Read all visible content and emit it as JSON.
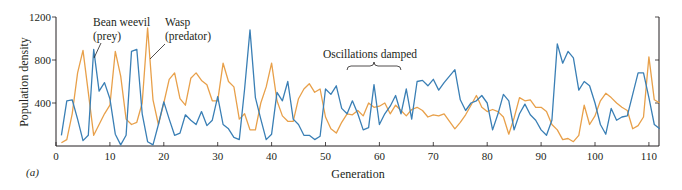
{
  "chart_data": {
    "type": "line",
    "title": "",
    "panel_label": "(a)",
    "xlabel": "Generation",
    "ylabel": "Population density",
    "xlim": [
      0,
      112
    ],
    "ylim": [
      0,
      1200
    ],
    "xticks": [
      0,
      10,
      20,
      30,
      40,
      50,
      60,
      70,
      80,
      90,
      100,
      110
    ],
    "yticks": [
      400,
      800,
      1200
    ],
    "grid": false,
    "annotations": [
      {
        "text": "Oscillations damped",
        "x_range": [
          54,
          64
        ]
      },
      {
        "text": "Bean weevil (prey)",
        "points_to_series": "Bean weevil (prey)"
      },
      {
        "text": "Wasp (predator)",
        "points_to_series": "Wasp (predator)"
      }
    ],
    "x": [
      1,
      2,
      3,
      4,
      5,
      6,
      7,
      8,
      9,
      10,
      11,
      12,
      13,
      14,
      15,
      16,
      17,
      18,
      19,
      20,
      21,
      22,
      23,
      24,
      25,
      26,
      27,
      28,
      29,
      30,
      31,
      32,
      33,
      34,
      35,
      36,
      37,
      38,
      39,
      40,
      41,
      42,
      43,
      44,
      45,
      46,
      47,
      48,
      49,
      50,
      51,
      52,
      53,
      54,
      55,
      56,
      57,
      58,
      59,
      60,
      61,
      62,
      63,
      64,
      65,
      66,
      67,
      68,
      69,
      70,
      71,
      72,
      73,
      74,
      75,
      76,
      77,
      78,
      79,
      80,
      81,
      82,
      83,
      84,
      85,
      86,
      87,
      88,
      89,
      90,
      91,
      92,
      93,
      94,
      95,
      96,
      97,
      98,
      99,
      100,
      101,
      102,
      103,
      104,
      105,
      106,
      107,
      108,
      109,
      110,
      111,
      112
    ],
    "series": [
      {
        "name": "Bean weevil (prey)",
        "color": "#3a7fb5",
        "values": [
          100,
          420,
          430,
          250,
          50,
          100,
          900,
          510,
          590,
          440,
          110,
          10,
          100,
          880,
          900,
          300,
          40,
          10,
          200,
          410,
          250,
          100,
          120,
          290,
          240,
          200,
          320,
          190,
          240,
          460,
          200,
          160,
          80,
          60,
          530,
          1080,
          450,
          250,
          60,
          110,
          500,
          420,
          600,
          250,
          200,
          100,
          100,
          60,
          90,
          530,
          480,
          560,
          350,
          300,
          420,
          300,
          150,
          170,
          570,
          200,
          300,
          370,
          470,
          300,
          530,
          250,
          600,
          610,
          560,
          620,
          520,
          590,
          650,
          710,
          430,
          330,
          400,
          420,
          470,
          400,
          150,
          300,
          480,
          420,
          150,
          300,
          390,
          290,
          240,
          150,
          100,
          240,
          950,
          770,
          880,
          820,
          520,
          600,
          560,
          400,
          200,
          110,
          350,
          240,
          270,
          280,
          480,
          680,
          680,
          450,
          200,
          160
        ],
        "legend_position": "inline annotation"
      },
      {
        "name": "Wasp (predator)",
        "color": "#e8a04a",
        "values": [
          30,
          60,
          300,
          680,
          890,
          500,
          100,
          200,
          300,
          380,
          880,
          650,
          250,
          200,
          220,
          400,
          1100,
          430,
          200,
          400,
          620,
          680,
          440,
          380,
          630,
          680,
          610,
          570,
          420,
          420,
          770,
          600,
          550,
          250,
          300,
          150,
          150,
          400,
          550,
          770,
          420,
          280,
          230,
          230,
          440,
          530,
          580,
          500,
          530,
          270,
          160,
          120,
          220,
          300,
          290,
          330,
          280,
          400,
          360,
          370,
          400,
          300,
          380,
          330,
          280,
          340,
          360,
          330,
          270,
          290,
          280,
          300,
          230,
          160,
          220,
          290,
          380,
          470,
          360,
          320,
          340,
          320,
          270,
          110,
          260,
          450,
          420,
          430,
          360,
          360,
          320,
          200,
          150,
          60,
          70,
          40,
          100,
          380,
          200,
          280,
          420,
          490,
          450,
          400,
          360,
          330,
          160,
          190,
          270,
          830,
          430,
          400
        ]
      }
    ]
  }
}
